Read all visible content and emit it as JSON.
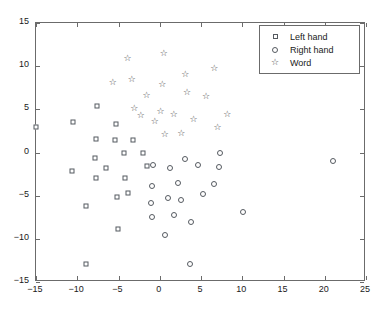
{
  "chart_data": {
    "type": "scatter",
    "title": "",
    "xlabel": "",
    "ylabel": "",
    "xlim": [
      -15,
      25
    ],
    "ylim": [
      -15,
      15
    ],
    "xticks": [
      -15,
      -10,
      -5,
      0,
      5,
      10,
      15,
      20,
      25
    ],
    "yticks": [
      -15,
      -10,
      -5,
      0,
      5,
      10,
      15
    ],
    "xticklabels": [
      "-15",
      "-10",
      "-5",
      "0",
      "5",
      "10",
      "15",
      "20",
      "25"
    ],
    "yticklabels": [
      "-15",
      "-10",
      "-5",
      "0",
      "5",
      "10",
      "15"
    ],
    "grid": false,
    "legend_position": "upper right",
    "marker_edge_color": "#555a60",
    "marker_face_color": "#ffffff",
    "axis_color": "#6b6b6b",
    "series": [
      {
        "name": "Left hand",
        "marker": "square",
        "points": [
          [
            -15.0,
            3.0
          ],
          [
            -10.5,
            3.5
          ],
          [
            -10.6,
            -2.1
          ],
          [
            -9.0,
            -12.9
          ],
          [
            -8.9,
            -6.2
          ],
          [
            -7.6,
            5.4
          ],
          [
            -7.7,
            1.6
          ],
          [
            -7.8,
            -0.6
          ],
          [
            -7.7,
            -3.0
          ],
          [
            -6.5,
            -1.8
          ],
          [
            -5.3,
            3.3
          ],
          [
            -5.4,
            1.5
          ],
          [
            -5.2,
            -5.2
          ],
          [
            -5.1,
            -8.9
          ],
          [
            -4.3,
            -0.1
          ],
          [
            -4.2,
            -2.9
          ],
          [
            -3.9,
            -4.7
          ],
          [
            -3.2,
            1.5
          ],
          [
            -2.0,
            0.0
          ],
          [
            -1.6,
            -1.6
          ]
        ]
      },
      {
        "name": "Right hand",
        "marker": "circle",
        "points": [
          [
            -1.1,
            -5.8
          ],
          [
            -1.0,
            -7.5
          ],
          [
            -0.9,
            -3.9
          ],
          [
            -0.8,
            -1.4
          ],
          [
            0.6,
            -9.5
          ],
          [
            1.0,
            -5.3
          ],
          [
            1.3,
            -1.8
          ],
          [
            1.7,
            -7.2
          ],
          [
            2.2,
            -3.5
          ],
          [
            2.6,
            -5.5
          ],
          [
            3.0,
            -0.8
          ],
          [
            3.7,
            -12.9
          ],
          [
            3.8,
            -8.0
          ],
          [
            4.6,
            -1.4
          ],
          [
            5.2,
            -4.8
          ],
          [
            6.6,
            -3.6
          ],
          [
            7.2,
            -1.7
          ],
          [
            7.3,
            0.0
          ],
          [
            10.1,
            -6.9
          ],
          [
            21.0,
            -1.0
          ]
        ]
      },
      {
        "name": "Word",
        "marker": "star",
        "points": [
          [
            -5.7,
            8.2
          ],
          [
            -3.9,
            10.9
          ],
          [
            -3.4,
            8.5
          ],
          [
            -3.1,
            5.2
          ],
          [
            -2.3,
            4.4
          ],
          [
            -1.6,
            6.7
          ],
          [
            0.3,
            7.9
          ],
          [
            0.5,
            11.5
          ],
          [
            0.1,
            4.8
          ],
          [
            -0.6,
            3.6
          ],
          [
            0.6,
            2.1
          ],
          [
            1.7,
            4.5
          ],
          [
            3.1,
            9.1
          ],
          [
            2.6,
            2.3
          ],
          [
            3.3,
            7.0
          ],
          [
            4.1,
            3.9
          ],
          [
            5.6,
            6.5
          ],
          [
            6.6,
            9.8
          ],
          [
            7.0,
            3.0
          ],
          [
            8.2,
            4.5
          ]
        ]
      }
    ]
  },
  "legend": {
    "items": [
      {
        "label": "Left hand",
        "marker": "square"
      },
      {
        "label": "Right hand",
        "marker": "circle"
      },
      {
        "label": "Word",
        "marker": "star"
      }
    ]
  }
}
